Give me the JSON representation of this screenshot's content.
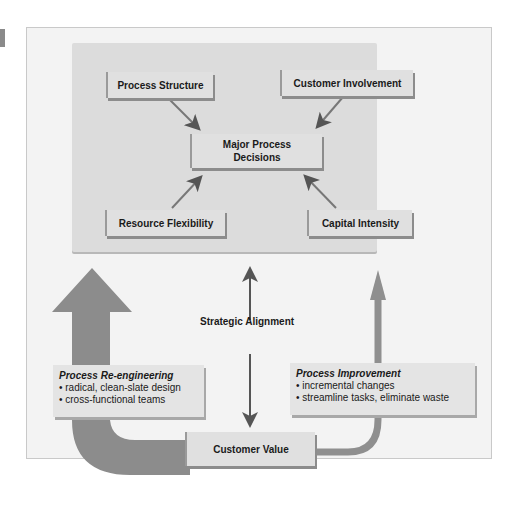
{
  "diagram": {
    "top_nodes": {
      "center": "Major Process\nDecisions",
      "top_left": "Process Structure",
      "top_right": "Customer Involvement",
      "bottom_left": "Resource Flexibility",
      "bottom_right": "Capital Intensity"
    },
    "middle_label": "Strategic Alignment",
    "bottom_node": "Customer Value",
    "left_box": {
      "title": "Process Re-engineering",
      "bullets": [
        "radical, clean-slate design",
        "cross-functional teams"
      ]
    },
    "right_box": {
      "title": "Process Improvement",
      "bullets": [
        "incremental changes",
        "streamline tasks, eliminate waste"
      ]
    },
    "colors": {
      "outer_bg": "#f3f3f3",
      "inner_panel": "#dcdcdc",
      "box_fill": "#e0e0e0",
      "big_arrow": "#8c8c8c",
      "small_arrow": "#9a9a9a",
      "text": "#1a1a1a"
    }
  }
}
